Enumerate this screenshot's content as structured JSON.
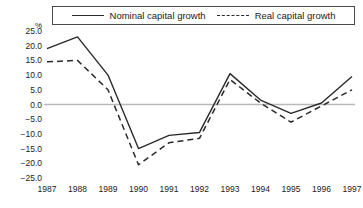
{
  "chart_data": {
    "type": "line",
    "title": "",
    "subtitle": "",
    "xlabel": "",
    "ylabel": "%",
    "categories": [
      "1987",
      "1988",
      "1989",
      "1990",
      "1991",
      "1992",
      "1993",
      "1994",
      "1995",
      "1996",
      "1997"
    ],
    "x": [
      1987,
      1988,
      1989,
      1990,
      1991,
      1992,
      1993,
      1994,
      1995,
      1996,
      1997
    ],
    "series": [
      {
        "name": "Nominal capital growth",
        "style": "solid",
        "color": "#2a2a2a",
        "values": [
          19.0,
          23.0,
          10.0,
          -15.0,
          -10.5,
          -9.5,
          10.5,
          1.5,
          -3.0,
          0.5,
          9.5
        ]
      },
      {
        "name": "Real capital growth",
        "style": "dashed",
        "color": "#2a2a2a",
        "values": [
          14.5,
          15.0,
          5.0,
          -20.5,
          -13.0,
          -11.5,
          8.5,
          0.5,
          -6.0,
          -0.5,
          5.0
        ]
      }
    ],
    "ylim": [
      -25.0,
      25.0
    ],
    "ytick_values": [
      25.0,
      20.0,
      15.0,
      10.0,
      5.0,
      0.0,
      -5.0,
      -10.0,
      -15.0,
      -20.0,
      -25.0
    ],
    "ytick_labels": [
      "25.0",
      "20.0",
      "15.0",
      "10.0",
      "5.0",
      "0.0",
      "−5.0",
      "−10.0",
      "−15.0",
      "−20.0",
      "−25.0"
    ],
    "grid": false,
    "zero_line": true,
    "zero_line_color": "#b9b9b9",
    "legend_position": "top",
    "legend_entries": [
      "Nominal capital growth",
      "Real capital growth"
    ]
  },
  "legend": {
    "nominal_label": "Nominal capital growth",
    "real_label": "Real capital growth"
  },
  "axis": {
    "percent_symbol": "%"
  }
}
